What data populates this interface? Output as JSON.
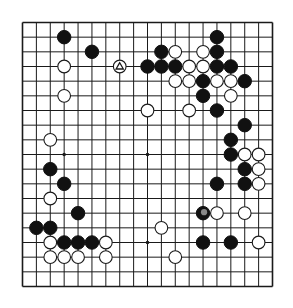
{
  "diagram": {
    "type": "go-board",
    "size": 19,
    "colors": {
      "board": "#f4f4f2",
      "line": "#1a1a1a",
      "black": "#111111",
      "white": "#ffffff",
      "marker": "#888888"
    },
    "star_points": [
      [
        3,
        3
      ],
      [
        9,
        3
      ],
      [
        15,
        3
      ],
      [
        3,
        9
      ],
      [
        9,
        9
      ],
      [
        15,
        9
      ],
      [
        3,
        15
      ],
      [
        9,
        15
      ],
      [
        15,
        15
      ]
    ],
    "black_stones": [
      [
        3,
        1
      ],
      [
        14,
        1
      ],
      [
        5,
        2
      ],
      [
        10,
        2
      ],
      [
        14,
        2
      ],
      [
        9,
        3
      ],
      [
        10,
        3
      ],
      [
        11,
        3
      ],
      [
        14,
        3
      ],
      [
        15,
        3
      ],
      [
        13,
        4
      ],
      [
        16,
        4
      ],
      [
        13,
        5
      ],
      [
        14,
        6
      ],
      [
        16,
        7
      ],
      [
        15,
        8
      ],
      [
        15,
        9
      ],
      [
        2,
        10
      ],
      [
        16,
        10
      ],
      [
        3,
        11
      ],
      [
        14,
        11
      ],
      [
        16,
        11
      ],
      [
        4,
        13
      ],
      [
        13,
        13
      ],
      [
        1,
        14
      ],
      [
        2,
        14
      ],
      [
        3,
        15
      ],
      [
        4,
        15
      ],
      [
        5,
        15
      ],
      [
        13,
        15
      ],
      [
        15,
        15
      ]
    ],
    "white_stones": [
      [
        11,
        2
      ],
      [
        13,
        2
      ],
      [
        3,
        3
      ],
      [
        7,
        3
      ],
      [
        12,
        3
      ],
      [
        13,
        3
      ],
      [
        11,
        4
      ],
      [
        12,
        4
      ],
      [
        14,
        4
      ],
      [
        15,
        4
      ],
      [
        3,
        5
      ],
      [
        15,
        5
      ],
      [
        9,
        6
      ],
      [
        12,
        6
      ],
      [
        2,
        8
      ],
      [
        16,
        9
      ],
      [
        17,
        9
      ],
      [
        17,
        10
      ],
      [
        17,
        11
      ],
      [
        2,
        12
      ],
      [
        14,
        13
      ],
      [
        16,
        13
      ],
      [
        10,
        14
      ],
      [
        2,
        15
      ],
      [
        6,
        15
      ],
      [
        17,
        15
      ],
      [
        2,
        16
      ],
      [
        3,
        16
      ],
      [
        4,
        16
      ],
      [
        6,
        16
      ],
      [
        11,
        16
      ]
    ],
    "markers": [
      {
        "type": "triangle",
        "point": [
          7,
          3
        ],
        "on": "white"
      },
      {
        "type": "highlight-circle",
        "point": [
          13,
          13
        ],
        "on": "black"
      }
    ]
  }
}
